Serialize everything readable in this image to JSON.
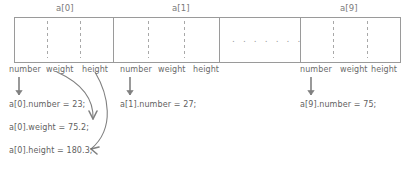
{
  "diagram": {
    "title_labels": [
      {
        "text": "a[0]",
        "x": 56,
        "y": 3
      },
      {
        "text": "a[1]",
        "x": 172,
        "y": 3
      },
      {
        "text": "a[9]",
        "x": 340,
        "y": 3
      }
    ],
    "cells": [
      {
        "name": "a0",
        "x": 14,
        "y": 17,
        "w": 99,
        "h": 45,
        "subdividers": [
          33,
          66
        ],
        "ellipsis": false
      },
      {
        "name": "a1",
        "x": 113,
        "y": 17,
        "w": 106,
        "h": 45,
        "subdividers": [
          35,
          71
        ],
        "ellipsis": false
      },
      {
        "name": "gap",
        "x": 219,
        "y": 17,
        "w": 81,
        "h": 45,
        "subdividers": [],
        "ellipsis": true
      },
      {
        "name": "a9",
        "x": 300,
        "y": 17,
        "w": 100,
        "h": 45,
        "subdividers": [
          33,
          67
        ],
        "ellipsis": false
      }
    ],
    "ellipsis_text": ". . . . . . .",
    "ellipsis_x": 232,
    "ellipsis_y": 34,
    "field_labels": [
      {
        "text": "number",
        "x": 9,
        "y": 65
      },
      {
        "text": "weight",
        "x": 46,
        "y": 65
      },
      {
        "text": "height",
        "x": 82,
        "y": 65
      },
      {
        "text": "number",
        "x": 120,
        "y": 65
      },
      {
        "text": "weight",
        "x": 158,
        "y": 65
      },
      {
        "text": "height",
        "x": 193,
        "y": 65
      },
      {
        "text": "number",
        "x": 300,
        "y": 65
      },
      {
        "text": "weight",
        "x": 340,
        "y": 65
      },
      {
        "text": "height",
        "x": 371,
        "y": 65
      }
    ],
    "statements": [
      {
        "name": "a0-number",
        "text": "a[0].number = 23;",
        "x": 9,
        "y": 100
      },
      {
        "name": "a0-weight",
        "text": "a[0].weight = 75.2;",
        "x": 9,
        "y": 123
      },
      {
        "name": "a0-height",
        "text": "a[0].height = 180.3;",
        "x": 9,
        "y": 146
      },
      {
        "name": "a1-number",
        "text": "a[1].number = 27;",
        "x": 120,
        "y": 100
      },
      {
        "name": "a9-number",
        "text": "a[9].number = 75;",
        "x": 300,
        "y": 100
      }
    ],
    "straight_arrows": [
      {
        "name": "arrow-a0-number",
        "x": 19,
        "y1": 77,
        "y2": 95
      },
      {
        "name": "arrow-a1-number",
        "x": 130,
        "y1": 77,
        "y2": 95
      },
      {
        "name": "arrow-a9-number",
        "x": 311,
        "y1": 77,
        "y2": 95
      }
    ],
    "curved_arrows": [
      {
        "name": "arrow-a0-weight",
        "path": "M 57,72 C 79,82 94,96 93,119",
        "tip": "M 93,119 L 89,111 M 93,119 L 97,111"
      },
      {
        "name": "arrow-a0-height",
        "path": "M 95,72 C 108,94 116,128 91,149",
        "tip": "M 91,149 L 99,147 M 91,149 L 97,154"
      }
    ],
    "colors": {
      "stroke": "#9a9a9a",
      "dash": "#a8a8a8",
      "arrow": "#808080",
      "text": "#6a6a6a"
    }
  }
}
